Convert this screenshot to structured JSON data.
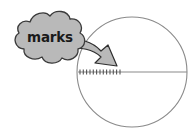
{
  "figure": {
    "title": "marks",
    "type": "geometry-annotation-diagram",
    "background_color": "#ffffff"
  },
  "callout": {
    "label": "marks",
    "shape": "cloud-bubble",
    "fill_color": "#b9b9b9",
    "stroke_color": "#3a3a3a",
    "text_color": "#1a1a1a"
  },
  "arrow": {
    "name": "curved-pointer-arrow",
    "fill_color": "#b9b9b9",
    "stroke_color": "#2e2e2e",
    "direction": "down-right",
    "points_to": "tick-marks"
  },
  "circle": {
    "name": "circle-outline",
    "stroke_color": "#8a8a8a",
    "center_x": 132,
    "center_y": 72,
    "radius": 55
  },
  "diameter_line": {
    "name": "horizontal-diameter-line",
    "stroke_color": "#8a8a8a",
    "y": 72,
    "x_start": 78,
    "x_end": 187
  },
  "tick_marks": {
    "name": "tick-marks-group",
    "count": 13,
    "stroke_color": "#555555",
    "x_start": 80,
    "x_end": 120,
    "spacing": 3.3,
    "height": 5
  }
}
